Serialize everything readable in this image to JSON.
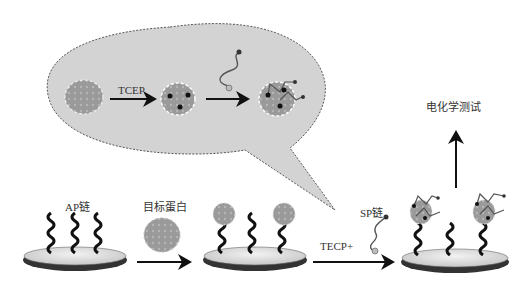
{
  "diagram": {
    "bubble": {
      "step1_label": "TCEP"
    },
    "labels": {
      "ap_chain": "AP链",
      "target_protein": "目标蛋白",
      "sp_chain": "SP链",
      "tecp_plus": "TECP+",
      "electrochemical_test": "电化学测试"
    },
    "colors": {
      "bubble_fill": "#d3d3d3",
      "protein": "#999999",
      "strand": "#111111",
      "electrode_top": "#e6e6e6",
      "electrode_rim": "#444444"
    }
  }
}
